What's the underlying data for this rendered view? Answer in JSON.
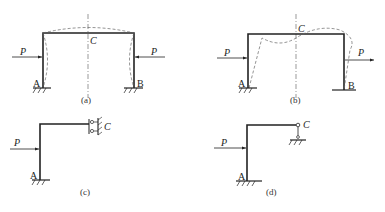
{
  "figure": {
    "panels": [
      {
        "id": "a",
        "caption": "(a)",
        "labels": {
          "load_left": "P",
          "load_right": "P",
          "support_left": "A",
          "support_right": "B",
          "midpoint": "C"
        },
        "description": "Symmetric portal frame with fixed supports A and B, equal compressive loads P from both sides; dashed symmetric deformed shape; dash-dot axis of symmetry through C"
      },
      {
        "id": "b",
        "caption": "(b)",
        "labels": {
          "load_left": "P",
          "load_right": "P",
          "support_left": "A",
          "support_right": "B",
          "midpoint": "C"
        },
        "description": "Symmetric portal frame with antisymmetric loads P (both pointing right); dashed antisymmetric deformed shape; dash-dot axis of symmetry through C"
      },
      {
        "id": "c",
        "caption": "(c)",
        "labels": {
          "load": "P",
          "support": "A",
          "end": "C"
        },
        "description": "Half frame with fixed support A and sliding (guided) support at C"
      },
      {
        "id": "d",
        "caption": "(d)",
        "labels": {
          "load": "P",
          "support": "A",
          "end": "C"
        },
        "description": "Half frame with fixed support A and vertical roller/link support at C"
      }
    ]
  }
}
